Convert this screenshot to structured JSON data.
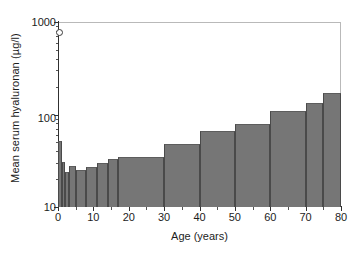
{
  "chart_data": {
    "type": "bar",
    "title": "",
    "xlabel": "Age (years)",
    "ylabel": "Mean serum hyaluronan (µg/l)",
    "yscale": "log",
    "ylim": [
      10,
      1000
    ],
    "xlim": [
      0,
      80
    ],
    "grid": false,
    "legend": null,
    "ytick_labels": [
      "1000",
      "100",
      "10"
    ],
    "ytick_values": [
      1000,
      100,
      10
    ],
    "xtick_labels": [
      "0",
      "10",
      "20",
      "30",
      "40",
      "50",
      "60",
      "70",
      "80"
    ],
    "xtick_values": [
      0,
      10,
      20,
      30,
      40,
      50,
      60,
      70,
      80
    ],
    "bar_color": "#767676",
    "bar_edge_color": "#4a4a4a",
    "axis_color": "#303030",
    "bins": [
      {
        "label": "0-1",
        "x0": 0,
        "x1": 1,
        "value": 52
      },
      {
        "label": "1-2",
        "x0": 1,
        "x1": 2,
        "value": 31
      },
      {
        "label": "2-3",
        "x0": 2,
        "x1": 3,
        "value": 24
      },
      {
        "label": "3-5",
        "x0": 3,
        "x1": 5,
        "value": 28
      },
      {
        "label": "5-8",
        "x0": 5,
        "x1": 8,
        "value": 25
      },
      {
        "label": "8-11",
        "x0": 8,
        "x1": 11,
        "value": 27
      },
      {
        "label": "11-14",
        "x0": 11,
        "x1": 14,
        "value": 30
      },
      {
        "label": "14-17",
        "x0": 14,
        "x1": 17,
        "value": 33
      },
      {
        "label": "17-30",
        "x0": 17,
        "x1": 30,
        "value": 35
      },
      {
        "label": "30-40",
        "x0": 30,
        "x1": 40,
        "value": 48
      },
      {
        "label": "40-50",
        "x0": 40,
        "x1": 50,
        "value": 67
      },
      {
        "label": "50-60",
        "x0": 50,
        "x1": 60,
        "value": 78
      },
      {
        "label": "60-70",
        "x0": 60,
        "x1": 70,
        "value": 108
      },
      {
        "label": "70-75",
        "x0": 70,
        "x1": 75,
        "value": 134
      },
      {
        "label": "75-80",
        "x0": 75,
        "x1": 80,
        "value": 170
      }
    ],
    "annotations": [
      {
        "name": "top-axis-marker",
        "y": 800,
        "note": "small open circle marker on y-axis below 1000"
      }
    ]
  }
}
